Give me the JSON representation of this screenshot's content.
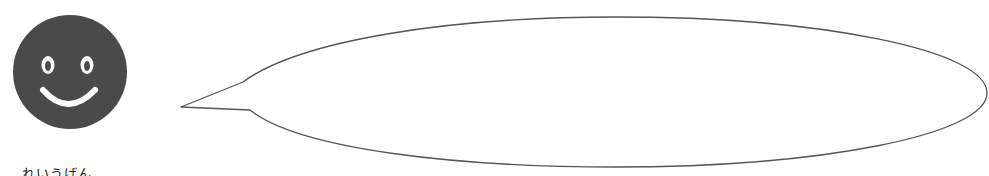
{
  "face": {
    "icon": "smiley-face-icon",
    "fill": "#4a4a4a",
    "feature_color": "#ffffff",
    "cx": 70,
    "cy": 72,
    "r": 57
  },
  "speech_bubble": {
    "icon": "speech-bubble-icon",
    "stroke": "#555555",
    "fill": "#ffffff",
    "text": ""
  },
  "caption": {
    "text": "れいうげん"
  }
}
